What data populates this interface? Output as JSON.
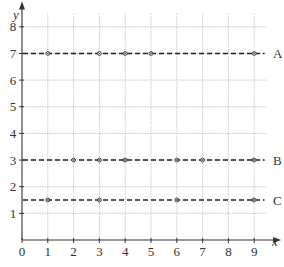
{
  "chart_data": {
    "type": "line",
    "title": "",
    "xlabel": "x",
    "ylabel": "y",
    "xlim": [
      0,
      9.5
    ],
    "ylim": [
      0,
      8.5
    ],
    "x_ticks": [
      0,
      1,
      2,
      3,
      4,
      5,
      6,
      7,
      8,
      9
    ],
    "y_ticks": [
      1,
      2,
      3,
      4,
      5,
      6,
      7,
      8
    ],
    "grid": true,
    "legend": "inline labels at right end of each line",
    "series": [
      {
        "name": "A",
        "y": 7,
        "style": "dashed",
        "points": [
          [
            1,
            7
          ],
          [
            3,
            7
          ],
          [
            4,
            7
          ],
          [
            5,
            7
          ],
          [
            9,
            7
          ]
        ]
      },
      {
        "name": "B",
        "y": 3,
        "style": "dashed",
        "points": [
          [
            2,
            3
          ],
          [
            3,
            3
          ],
          [
            4,
            3
          ],
          [
            6,
            3
          ],
          [
            7,
            3
          ],
          [
            9,
            3
          ]
        ]
      },
      {
        "name": "C",
        "y": 1.5,
        "style": "dashed",
        "points": [
          [
            1,
            1.5
          ],
          [
            3,
            1.5
          ],
          [
            6,
            1.5
          ],
          [
            9,
            1.5
          ]
        ]
      }
    ]
  },
  "colors": {
    "axis": "#333333",
    "grid": "#bbbbbb",
    "line": "#222222",
    "marker": "#444444"
  }
}
